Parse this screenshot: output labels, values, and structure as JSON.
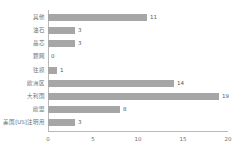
{
  "chart_data": {
    "type": "bar",
    "orientation": "horizontal",
    "title": "",
    "subtitle": "",
    "xlabel": "",
    "ylabel": "",
    "xlim": [
      0,
      20
    ],
    "xticks": [
      0,
      5,
      10,
      15,
      20
    ],
    "grid": false,
    "legend": null,
    "bar_color": "#a6a6a6",
    "text_color": "#6f6f6f",
    "axis_color": "#b8b8b8",
    "categories": [
      "其他",
      "油石",
      "晶芯",
      "颗网",
      "往摸",
      "欧洲区",
      "大利国",
      "欧盟",
      "美国[US]注明用"
    ],
    "values": [
      11,
      3,
      3,
      0,
      1,
      14,
      19,
      8,
      3
    ],
    "value_labels": [
      "11",
      "3",
      "3",
      "0",
      "1",
      "14",
      "19",
      "8",
      "3"
    ],
    "tick_labels": [
      "0",
      "5",
      "10",
      "15",
      "20"
    ]
  }
}
